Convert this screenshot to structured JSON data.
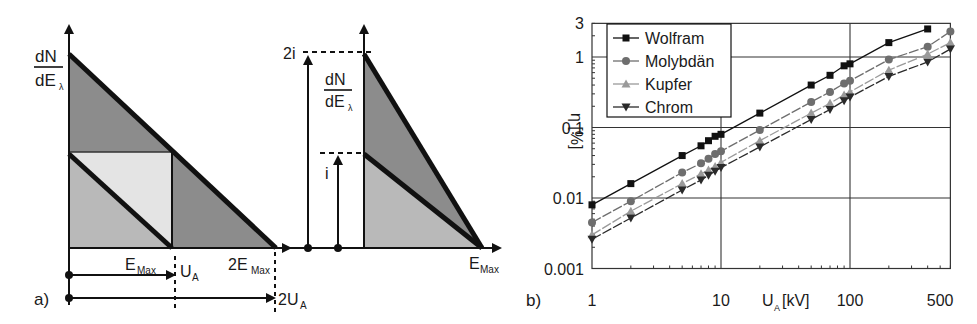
{
  "panel_a": {
    "label": "a)",
    "y_axis_label_num": "dN",
    "y_axis_label_den": "dE",
    "y_axis_label_sub": "λ",
    "x_label_emax": "E",
    "x_label_emax_sub": "Max",
    "x_label_2emax": "2E",
    "x_label_2emax_sub": "Max",
    "ua_label": "U",
    "ua_sub": "A",
    "two_ua_label": "2U",
    "two_ua_sub": "A"
  },
  "panel_a2": {
    "current_2i": "2i",
    "current_i": "i",
    "y_axis_label_num": "dN",
    "y_axis_label_den": "dE",
    "y_axis_label_sub": "λ",
    "x_label": "E",
    "x_label_sub": "Max"
  },
  "panel_b": {
    "label": "b)"
  },
  "colors": {
    "dark_fill": "#8c8c8c",
    "mid_fill": "#b9b9b9",
    "light_fill": "#e4e4e4",
    "line": "#111111",
    "wolfram": "#111111",
    "molybdaen": "#6e6e6e",
    "kupfer": "#9a9a9a",
    "chrom": "#2a2a2a"
  },
  "chart_data": {
    "type": "line",
    "title": "",
    "xlabel": "U",
    "xlabel_sub": "A",
    "xlabel_unit": "[kV]",
    "ylabel": "η [%]",
    "xscale": "log",
    "yscale": "log",
    "xlim": [
      1,
      600
    ],
    "ylim": [
      0.001,
      3
    ],
    "x_ticks": [
      "1",
      "10",
      "100",
      "500"
    ],
    "y_ticks": [
      "0.001",
      "0.01",
      "0.1",
      "1",
      "3"
    ],
    "grid": true,
    "legend_position": "upper left",
    "x": [
      1,
      2,
      5,
      7,
      8,
      9,
      10,
      20,
      50,
      70,
      90,
      100,
      200,
      400,
      600
    ],
    "series": [
      {
        "name": "Wolfram",
        "marker": "square",
        "values": [
          0.008,
          0.016,
          0.04,
          0.055,
          0.065,
          0.075,
          0.08,
          0.16,
          0.4,
          0.55,
          0.75,
          0.8,
          1.6,
          2.5,
          null
        ]
      },
      {
        "name": "Molybdän",
        "marker": "circle",
        "values": [
          0.0045,
          0.009,
          0.023,
          0.031,
          0.036,
          0.042,
          0.046,
          0.092,
          0.23,
          0.32,
          0.42,
          0.46,
          0.92,
          1.4,
          2.3
        ]
      },
      {
        "name": "Kupfer",
        "marker": "triangle-up",
        "values": [
          0.003,
          0.0065,
          0.016,
          0.022,
          0.025,
          0.028,
          0.032,
          0.065,
          0.16,
          0.22,
          0.29,
          0.32,
          0.65,
          1.1,
          1.6
        ]
      },
      {
        "name": "Chrom",
        "marker": "triangle-down",
        "values": [
          0.0026,
          0.0052,
          0.013,
          0.018,
          0.021,
          0.024,
          0.027,
          0.053,
          0.13,
          0.18,
          0.24,
          0.27,
          0.53,
          0.85,
          1.3
        ]
      }
    ]
  }
}
